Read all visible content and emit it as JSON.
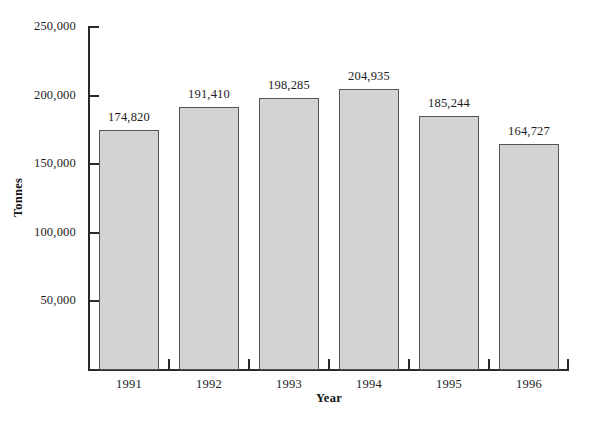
{
  "chart_data": {
    "type": "bar",
    "title": "",
    "xlabel": "Year",
    "ylabel": "Tonnes",
    "categories": [
      "1991",
      "1992",
      "1993",
      "1994",
      "1995",
      "1996"
    ],
    "values": [
      174820,
      191410,
      198285,
      204935,
      185244,
      164727
    ],
    "value_labels": [
      "174,820",
      "191,410",
      "198,285",
      "204,935",
      "185,244",
      "164,727"
    ],
    "ylim": [
      0,
      250000
    ],
    "y_ticks": [
      50000,
      100000,
      150000,
      200000,
      250000
    ],
    "y_tick_labels": [
      "50,000",
      "100,000",
      "150,000",
      "200,000",
      "250,000"
    ],
    "grid": false,
    "legend": null,
    "bar_color": "#d3d3d3",
    "bar_edge_color": "#555555",
    "axis_color": "#2a2a2a"
  }
}
